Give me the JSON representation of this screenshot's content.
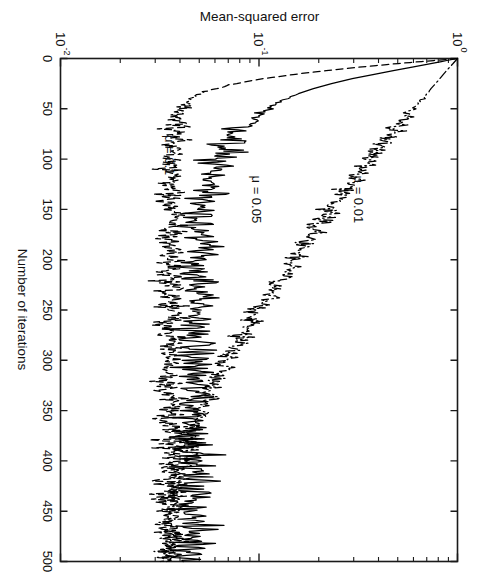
{
  "figure": {
    "rotation_note": "page-rotated-90-clockwise",
    "background_color": "#ffffff",
    "ink_color": "#000000"
  },
  "axes": {
    "x_title": "Number of iterations",
    "y_title": "Mean-squared error",
    "x_ticks": [
      "0",
      "50",
      "100",
      "150",
      "200",
      "250",
      "300",
      "350",
      "400",
      "450",
      "500"
    ],
    "x_tick_values": [
      0,
      50,
      100,
      150,
      200,
      250,
      300,
      350,
      400,
      450,
      500
    ],
    "y_ticks": [
      "10⁰",
      "10⁻¹",
      "10⁻²"
    ],
    "y_tick_mantissa": [
      "10",
      "10",
      "10"
    ],
    "y_tick_exponent": [
      "0",
      "-1",
      "-2"
    ],
    "y_tick_values": [
      1,
      0.1,
      0.01
    ],
    "y_scale": "log"
  },
  "annotations": [
    {
      "name": "mu-001-label",
      "text": "μ = 0.01",
      "x": 140,
      "y": 0.3
    },
    {
      "name": "mu-005-label",
      "text": "μ = 0.05",
      "x": 140,
      "y": 0.092
    },
    {
      "name": "mu-01-label",
      "text": "μ = 0.1",
      "x": 96,
      "y": 0.0335
    }
  ],
  "chart_data": {
    "type": "line",
    "title": "",
    "subtitle": "",
    "xlabel": "Number of iterations",
    "ylabel": "Mean-squared error",
    "xlim": [
      0,
      500
    ],
    "ylim": [
      0.01,
      1
    ],
    "yscale": "log",
    "xscale": "linear",
    "grid": false,
    "legend": "inline-annotations",
    "xticks": [
      0,
      50,
      100,
      150,
      200,
      250,
      300,
      350,
      400,
      450,
      500
    ],
    "yticks": [
      1,
      0.1,
      0.01
    ],
    "series": [
      {
        "name": "μ = 0.01",
        "style": "dash-dot",
        "color": "#000000",
        "x": [
          0,
          5,
          10,
          15,
          20,
          25,
          30,
          35,
          40,
          45,
          50,
          55,
          60,
          65,
          70,
          75,
          80,
          85,
          90,
          95,
          100,
          110,
          120,
          130,
          140,
          150,
          160,
          170,
          180,
          190,
          200,
          210,
          220,
          230,
          240,
          250,
          260,
          270,
          280,
          290,
          300,
          310,
          320,
          330,
          340,
          350,
          360,
          370,
          380,
          390,
          400,
          410,
          420,
          430,
          440,
          450,
          460,
          470,
          480,
          490,
          500
        ],
        "y": [
          1.0,
          0.95,
          0.9,
          0.855,
          0.815,
          0.775,
          0.735,
          0.7,
          0.665,
          0.63,
          0.6,
          0.575,
          0.545,
          0.52,
          0.495,
          0.47,
          0.445,
          0.425,
          0.405,
          0.385,
          0.365,
          0.335,
          0.305,
          0.278,
          0.254,
          0.232,
          0.212,
          0.194,
          0.178,
          0.163,
          0.15,
          0.138,
          0.127,
          0.117,
          0.108,
          0.1,
          0.0925,
          0.0858,
          0.0798,
          0.0744,
          0.0696,
          0.0653,
          0.0614,
          0.058,
          0.0549,
          0.0521,
          0.0496,
          0.0474,
          0.0454,
          0.0436,
          0.042,
          0.0405,
          0.0392,
          0.0381,
          0.0371,
          0.0362,
          0.0354,
          0.0347,
          0.0341,
          0.0336,
          0.0332
        ]
      },
      {
        "name": "μ = 0.05",
        "style": "solid",
        "color": "#000000",
        "x": [
          0,
          4,
          8,
          12,
          16,
          20,
          25,
          30,
          35,
          40,
          45,
          50,
          55,
          60,
          65,
          70,
          75,
          80,
          85,
          90,
          95,
          100,
          110,
          120,
          130,
          140,
          150,
          160,
          170,
          180,
          190,
          200,
          220,
          240,
          260,
          280,
          300,
          320,
          340,
          360,
          380,
          400,
          420,
          440,
          460,
          480,
          500
        ],
        "y": [
          1.0,
          0.78,
          0.61,
          0.475,
          0.375,
          0.295,
          0.232,
          0.188,
          0.158,
          0.138,
          0.124,
          0.112,
          0.102,
          0.0945,
          0.088,
          0.0825,
          0.078,
          0.0742,
          0.071,
          0.0682,
          0.0658,
          0.0638,
          0.0604,
          0.0578,
          0.0558,
          0.0542,
          0.0529,
          0.0519,
          0.0511,
          0.0504,
          0.0499,
          0.0494,
          0.0487,
          0.0482,
          0.0478,
          0.0476,
          0.0474,
          0.0472,
          0.0471,
          0.047,
          0.047,
          0.0469,
          0.0469,
          0.0469,
          0.0468,
          0.0468,
          0.0468
        ]
      },
      {
        "name": "μ = 0.1",
        "style": "dashed",
        "color": "#000000",
        "x": [
          0,
          3,
          6,
          9,
          12,
          15,
          20,
          25,
          30,
          35,
          40,
          45,
          50,
          60,
          70,
          80,
          90,
          100,
          120,
          140,
          160,
          180,
          200,
          225,
          250,
          275,
          300,
          325,
          350,
          375,
          400,
          425,
          450,
          475,
          500
        ],
        "y": [
          1.0,
          0.66,
          0.44,
          0.305,
          0.218,
          0.162,
          0.105,
          0.076,
          0.0605,
          0.0515,
          0.0462,
          0.043,
          0.041,
          0.0387,
          0.0376,
          0.037,
          0.0366,
          0.0364,
          0.0362,
          0.0361,
          0.036,
          0.036,
          0.0359,
          0.0359,
          0.0359,
          0.0359,
          0.0359,
          0.0359,
          0.0359,
          0.0359,
          0.0358,
          0.0358,
          0.0358,
          0.0358,
          0.0358
        ]
      }
    ],
    "series_noise": [
      {
        "name": "μ = 0.01",
        "onset_x": 30,
        "amplitude_db": 0.055,
        "description": "low-amplitude ripple growing after iteration 30"
      },
      {
        "name": "μ = 0.05",
        "onset_x": 35,
        "amplitude_db": 0.105,
        "description": "strong misadjustment noise, widest band"
      },
      {
        "name": "μ = 0.1",
        "onset_x": 20,
        "amplitude_db": 0.085,
        "description": "fast convergence, persistent excess noise floor"
      }
    ]
  }
}
